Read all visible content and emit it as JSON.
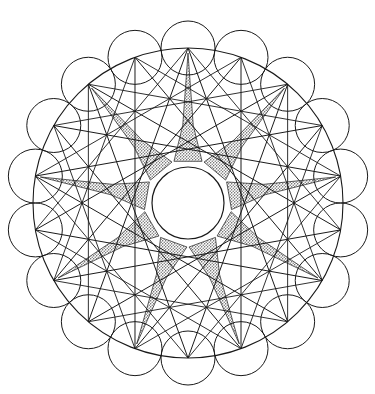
{
  "figure": {
    "type": "geometric-line-drawing",
    "canvas": {
      "width": 375,
      "height": 394,
      "background": "#ffffff"
    },
    "ink_color": "#1a1a1a",
    "shade_color": "#a9a9a9",
    "shade_style": "stipple-dot-screen",
    "main_circle": {
      "cx": 188,
      "cy": 203,
      "r": 155,
      "stroke_width": 1.1
    },
    "vertices": {
      "count": 18,
      "start_angle_deg": -90,
      "marker": "chord-endpoint"
    },
    "petal_circles": {
      "count": 18,
      "r": 27,
      "centers_on": "main_circle",
      "stroke_width": 1.0,
      "description": "small circles centred on each of the 18 main-circle vertices"
    },
    "chords": {
      "step": 7,
      "count": 18,
      "stroke_width": 1.0,
      "description": "each vertex joined to the vertex 7 places around, forming an 18/7 star polygon"
    },
    "secondary_chords": {
      "step": 5,
      "count": 18,
      "stroke_width": 0.9,
      "description": "second chord family at step 5 producing the finer cross-hatch web"
    },
    "shaded_star": {
      "points": 9,
      "outer_r": 150,
      "inner_r": 44,
      "tip_half_width_deg": 7,
      "fill": "#a9a9a9",
      "description": "nine shaded tapering star points radiating from the central hub"
    },
    "center_hub": {
      "cx": 188,
      "cy": 203,
      "r": 36,
      "fill": "#ffffff",
      "stroke": "#1a1a1a"
    }
  },
  "chart_data": {
    "type": "scatter",
    "xlabel": "",
    "ylabel": "",
    "xlim": [
      0,
      375
    ],
    "ylim": [
      0,
      394
    ],
    "grid": false,
    "legend": "none",
    "annotations": [
      "18 equally spaced vertices on a circle of radius 155 centred at (188, 203)",
      "18 small circles of radius 27 centred on those vertices",
      "Chord family A: step 7 (18/7 star polygon)",
      "Chord family B: step 5 (18/5 star polygon)",
      "9 stippled star points, outer radius 150, inner radius 44",
      "White central hub circle of radius 36"
    ],
    "series": [
      {
        "name": "main-circle-vertices",
        "n": 18,
        "cx": 188,
        "cy": 203,
        "r": 155,
        "start_angle_deg": -90,
        "angles_deg": [
          -90,
          -70,
          -50,
          -30,
          -10,
          10,
          30,
          50,
          70,
          90,
          110,
          130,
          150,
          170,
          190,
          210,
          230,
          250
        ]
      },
      {
        "name": "petal-circle-centres",
        "n": 18,
        "radius_each": 27
      },
      {
        "name": "star-point-tips",
        "n": 9,
        "r": 150,
        "angles_deg": [
          -90,
          -50,
          -10,
          30,
          70,
          110,
          150,
          190,
          230
        ]
      }
    ]
  }
}
